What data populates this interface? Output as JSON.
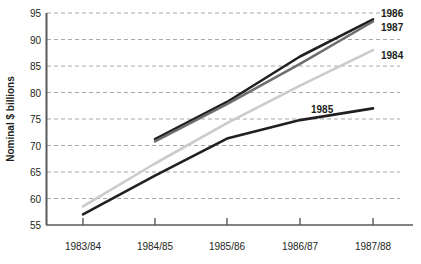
{
  "chart_data": {
    "type": "line",
    "title": "",
    "subtitle": "",
    "xlabel": "",
    "ylabel": "Nominal $ billions",
    "categories": [
      "1983/84",
      "1984/85",
      "1985/86",
      "1986/87",
      "1987/88"
    ],
    "ylim": [
      55,
      95
    ],
    "yticks": [
      55,
      60,
      65,
      70,
      75,
      80,
      85,
      90,
      95
    ],
    "ytick_labels": [
      "55",
      "60",
      "65",
      "70",
      "75",
      "80",
      "85",
      "90",
      "95"
    ],
    "grid": true,
    "grid_style": "dashed-horizontal",
    "grid_color": "#a7a9ac",
    "legend_position": "line-end-labels",
    "series": [
      {
        "name": "1984",
        "label": "1984",
        "color": "#c9cbcd",
        "x": [
          "1983/84",
          "1984/85",
          "1985/86",
          "1986/87",
          "1987/88"
        ],
        "values": [
          58.5,
          66.6,
          74.2,
          81.3,
          88.0
        ]
      },
      {
        "name": "1985",
        "label": "1985",
        "color": "#231f20",
        "x": [
          "1983/84",
          "1984/85",
          "1985/86",
          "1986/87",
          "1987/88"
        ],
        "values": [
          57.0,
          64.3,
          71.3,
          74.8,
          77.0
        ]
      },
      {
        "name": "1986",
        "label": "1986",
        "color": "#231f20",
        "x": [
          "1984/85",
          "1985/86",
          "1986/87",
          "1987/88"
        ],
        "values": [
          71.2,
          78.2,
          86.8,
          93.8
        ]
      },
      {
        "name": "1987",
        "label": "1987",
        "color": "#6d6e71",
        "x": [
          "1984/85",
          "1985/86",
          "1986/87",
          "1987/88"
        ],
        "values": [
          70.8,
          77.8,
          85.4,
          93.4
        ]
      }
    ]
  },
  "axes": {
    "y_axis_title": "Nominal $ billions",
    "y_tick_55": "55",
    "y_tick_60": "60",
    "y_tick_65": "65",
    "y_tick_70": "70",
    "y_tick_75": "75",
    "y_tick_80": "80",
    "y_tick_85": "85",
    "y_tick_90": "90",
    "y_tick_95": "95",
    "x_tick_1": "1983/84",
    "x_tick_2": "1984/85",
    "x_tick_3": "1985/86",
    "x_tick_4": "1986/87",
    "x_tick_5": "1987/88"
  },
  "series_labels": {
    "s1986": "1986",
    "s1987": "1987",
    "s1984": "1984",
    "s1985": "1985"
  },
  "colors": {
    "axis": "#58595b",
    "grid": "#a7a9ac",
    "text": "#231f20",
    "line_1984": "#c9cbcd",
    "line_1985": "#231f20",
    "line_1986": "#231f20",
    "line_1987": "#6d6e71"
  }
}
